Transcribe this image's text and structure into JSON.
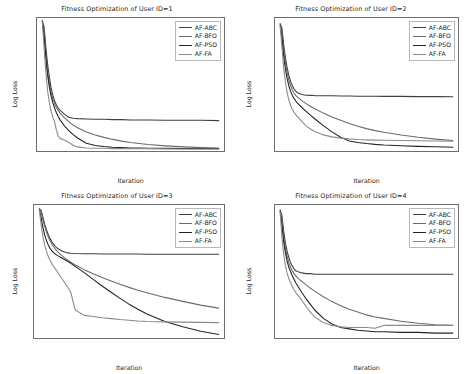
{
  "figure": {
    "background": "#ffffff",
    "series_colors": {
      "AF-ABC": "#3f3f3f",
      "AF-BFO": "#6b6b6b",
      "AF-PSO": "#242424",
      "AF-FA": "#8a8a8a"
    }
  },
  "chart_data": [
    {
      "type": "line",
      "title": "Fitness Optimization of User ID=1",
      "xlabel": "Iteration",
      "ylabel": "Log Loss",
      "xlim": [
        -30,
        1030
      ],
      "ylim": [
        0.335,
        0.725
      ],
      "xticks": [
        0,
        100,
        200,
        300,
        400,
        500,
        600,
        700,
        800,
        900,
        1000
      ],
      "yticks": [
        0.35,
        0.4,
        0.45,
        0.5,
        0.55,
        0.6,
        0.65,
        0.7
      ],
      "ytick_labels": [
        "0.35",
        "0.40",
        "0.45",
        "0.50",
        "0.55",
        "0.60",
        "0.65",
        "0.70"
      ],
      "grid": false,
      "legend_position": "upper right",
      "legend": [
        "AF-ABC",
        "AF-BFO",
        "AF-PSO",
        "AF-FA"
      ],
      "x": [
        0,
        10,
        20,
        30,
        40,
        50,
        60,
        70,
        80,
        90,
        100,
        125,
        150,
        175,
        200,
        250,
        300,
        350,
        400,
        450,
        500,
        550,
        600,
        700,
        800,
        900,
        1000
      ],
      "series": [
        {
          "name": "AF-ABC",
          "values": [
            0.715,
            0.7,
            0.64,
            0.59,
            0.552,
            0.52,
            0.498,
            0.482,
            0.47,
            0.461,
            0.455,
            0.443,
            0.434,
            0.431,
            0.43,
            0.429,
            0.428,
            0.428,
            0.427,
            0.427,
            0.426,
            0.426,
            0.426,
            0.425,
            0.425,
            0.425,
            0.424
          ]
        },
        {
          "name": "AF-BFO",
          "values": [
            0.718,
            0.688,
            0.62,
            0.57,
            0.533,
            0.506,
            0.487,
            0.473,
            0.462,
            0.454,
            0.447,
            0.433,
            0.421,
            0.411,
            0.403,
            0.391,
            0.382,
            0.375,
            0.369,
            0.364,
            0.36,
            0.357,
            0.354,
            0.35,
            0.347,
            0.345,
            0.344
          ]
        },
        {
          "name": "AF-PSO",
          "values": [
            0.716,
            0.672,
            0.606,
            0.558,
            0.523,
            0.496,
            0.476,
            0.46,
            0.447,
            0.436,
            0.427,
            0.409,
            0.395,
            0.383,
            0.373,
            0.358,
            0.351,
            0.348,
            0.346,
            0.345,
            0.344,
            0.344,
            0.343,
            0.343,
            0.342,
            0.342,
            0.342
          ]
        },
        {
          "name": "AF-FA",
          "values": [
            0.714,
            0.64,
            0.566,
            0.512,
            0.477,
            0.452,
            0.434,
            0.42,
            0.396,
            0.379,
            0.372,
            0.367,
            0.36,
            0.352,
            0.347,
            0.344,
            0.343,
            0.343,
            0.342,
            0.342,
            0.342,
            0.342,
            0.342,
            0.341,
            0.341,
            0.341,
            0.341
          ]
        }
      ]
    },
    {
      "type": "line",
      "title": "Fitness Optimization of User ID=2",
      "xlabel": "Iteration",
      "ylabel": "Log Loss",
      "xlim": [
        -30,
        1030
      ],
      "ylim": [
        0.925,
        1.585
      ],
      "xticks": [
        0,
        100,
        200,
        300,
        400,
        500,
        600,
        700,
        800,
        900,
        1000
      ],
      "yticks": [
        1.0,
        1.1,
        1.2,
        1.3,
        1.4,
        1.5
      ],
      "ytick_labels": [
        "1.0",
        "1.1",
        "1.2",
        "1.3",
        "1.4",
        "1.5"
      ],
      "grid": false,
      "legend_position": "upper right",
      "legend": [
        "AF-ABC",
        "AF-BFO",
        "AF-PSO",
        "AF-FA"
      ],
      "x": [
        0,
        10,
        20,
        30,
        40,
        50,
        60,
        70,
        80,
        90,
        100,
        125,
        150,
        175,
        200,
        250,
        300,
        350,
        400,
        450,
        500,
        550,
        600,
        700,
        800,
        900,
        1000
      ],
      "series": [
        {
          "name": "AF-ABC",
          "values": [
            1.555,
            1.535,
            1.455,
            1.39,
            1.34,
            1.3,
            1.272,
            1.25,
            1.234,
            1.222,
            1.214,
            1.205,
            1.202,
            1.201,
            1.2,
            1.199,
            1.199,
            1.198,
            1.198,
            1.197,
            1.197,
            1.197,
            1.196,
            1.196,
            1.195,
            1.195,
            1.194
          ]
        },
        {
          "name": "AF-BFO",
          "values": [
            1.558,
            1.52,
            1.432,
            1.366,
            1.316,
            1.278,
            1.25,
            1.229,
            1.213,
            1.201,
            1.192,
            1.175,
            1.16,
            1.147,
            1.135,
            1.113,
            1.094,
            1.077,
            1.061,
            1.048,
            1.036,
            1.026,
            1.018,
            1.004,
            0.993,
            0.984,
            0.977
          ]
        },
        {
          "name": "AF-PSO",
          "values": [
            1.55,
            1.49,
            1.398,
            1.333,
            1.285,
            1.249,
            1.222,
            1.202,
            1.186,
            1.173,
            1.163,
            1.141,
            1.122,
            1.103,
            1.085,
            1.051,
            1.02,
            0.993,
            0.975,
            0.967,
            0.962,
            0.958,
            0.955,
            0.951,
            0.948,
            0.946,
            0.944
          ]
        },
        {
          "name": "AF-FA",
          "values": [
            1.546,
            1.441,
            1.34,
            1.268,
            1.216,
            1.179,
            1.152,
            1.132,
            1.117,
            1.105,
            1.096,
            1.072,
            1.05,
            1.034,
            1.022,
            1.005,
            0.995,
            0.989,
            0.985,
            0.982,
            0.98,
            0.979,
            0.978,
            0.977,
            0.976,
            0.975,
            0.974
          ]
        }
      ]
    },
    {
      "type": "line",
      "title": "Fitness Optimization of User ID=3",
      "xlabel": "Iteration",
      "ylabel": "Log Loss",
      "xlim": [
        -30,
        1030
      ],
      "ylim": [
        0.365,
        0.935
      ],
      "xticks": [
        0,
        100,
        200,
        300,
        400,
        500,
        600,
        700,
        800,
        900,
        1000
      ],
      "yticks": [
        0.4,
        0.5,
        0.6,
        0.7,
        0.8,
        0.9
      ],
      "ytick_labels": [
        "0.4",
        "0.5",
        "0.6",
        "0.7",
        "0.8",
        "0.9"
      ],
      "grid": false,
      "legend_position": "upper right",
      "legend": [
        "AF-ABC",
        "AF-BFO",
        "AF-PSO",
        "AF-FA"
      ],
      "x": [
        0,
        10,
        20,
        30,
        40,
        50,
        60,
        70,
        80,
        90,
        100,
        125,
        150,
        175,
        200,
        250,
        300,
        350,
        400,
        450,
        500,
        550,
        600,
        700,
        800,
        900,
        1000
      ],
      "series": [
        {
          "name": "AF-ABC",
          "values": [
            0.918,
            0.912,
            0.882,
            0.853,
            0.828,
            0.808,
            0.791,
            0.777,
            0.766,
            0.757,
            0.75,
            0.738,
            0.731,
            0.728,
            0.727,
            0.726,
            0.726,
            0.725,
            0.725,
            0.725,
            0.725,
            0.725,
            0.724,
            0.724,
            0.724,
            0.724,
            0.724
          ]
        },
        {
          "name": "AF-BFO",
          "values": [
            0.921,
            0.906,
            0.871,
            0.842,
            0.818,
            0.798,
            0.781,
            0.767,
            0.755,
            0.745,
            0.736,
            0.718,
            0.703,
            0.69,
            0.678,
            0.658,
            0.64,
            0.624,
            0.609,
            0.595,
            0.582,
            0.57,
            0.559,
            0.539,
            0.522,
            0.506,
            0.493
          ]
        },
        {
          "name": "AF-PSO",
          "values": [
            0.915,
            0.88,
            0.838,
            0.806,
            0.782,
            0.763,
            0.749,
            0.738,
            0.73,
            0.724,
            0.719,
            0.708,
            0.697,
            0.685,
            0.672,
            0.645,
            0.616,
            0.588,
            0.561,
            0.535,
            0.51,
            0.488,
            0.468,
            0.436,
            0.413,
            0.394,
            0.38
          ]
        },
        {
          "name": "AF-FA",
          "values": [
            0.913,
            0.848,
            0.799,
            0.762,
            0.735,
            0.714,
            0.697,
            0.683,
            0.671,
            0.66,
            0.65,
            0.62,
            0.592,
            0.562,
            0.485,
            0.462,
            0.457,
            0.452,
            0.448,
            0.444,
            0.441,
            0.438,
            0.436,
            0.434,
            0.433,
            0.432,
            0.431
          ]
        }
      ]
    },
    {
      "type": "line",
      "title": "Fitness Optimization of User ID=4",
      "xlabel": "Iteration",
      "ylabel": "Log Loss",
      "xlim": [
        -30,
        1030
      ],
      "ylim": [
        0.268,
        0.458
      ],
      "xticks": [
        0,
        100,
        200,
        300,
        400,
        500,
        600,
        700,
        800,
        900,
        1000
      ],
      "yticks": [
        0.275,
        0.3,
        0.325,
        0.35,
        0.375,
        0.4,
        0.425,
        0.45
      ],
      "ytick_labels": [
        "0.275",
        "0.300",
        "0.325",
        "0.350",
        "0.375",
        "0.400",
        "0.425",
        "0.450"
      ],
      "grid": false,
      "legend_position": "upper right",
      "legend": [
        "AF-ABC",
        "AF-BFO",
        "AF-PSO",
        "AF-FA"
      ],
      "x": [
        0,
        10,
        20,
        30,
        40,
        50,
        60,
        70,
        80,
        90,
        100,
        125,
        150,
        175,
        200,
        250,
        300,
        350,
        400,
        450,
        500,
        550,
        600,
        700,
        800,
        900,
        1000
      ],
      "series": [
        {
          "name": "AF-ABC",
          "values": [
            0.45,
            0.443,
            0.421,
            0.404,
            0.392,
            0.383,
            0.376,
            0.371,
            0.367,
            0.364,
            0.363,
            0.361,
            0.36,
            0.36,
            0.359,
            0.359,
            0.359,
            0.359,
            0.359,
            0.359,
            0.359,
            0.359,
            0.359,
            0.359,
            0.359,
            0.359,
            0.359
          ]
        },
        {
          "name": "AF-BFO",
          "values": [
            0.451,
            0.438,
            0.414,
            0.397,
            0.385,
            0.376,
            0.369,
            0.364,
            0.36,
            0.357,
            0.354,
            0.349,
            0.344,
            0.339,
            0.335,
            0.327,
            0.32,
            0.314,
            0.309,
            0.305,
            0.301,
            0.298,
            0.296,
            0.292,
            0.289,
            0.287,
            0.286
          ]
        },
        {
          "name": "AF-PSO",
          "values": [
            0.449,
            0.429,
            0.406,
            0.39,
            0.378,
            0.369,
            0.363,
            0.357,
            0.352,
            0.347,
            0.343,
            0.333,
            0.324,
            0.316,
            0.308,
            0.296,
            0.288,
            0.283,
            0.281,
            0.279,
            0.278,
            0.277,
            0.277,
            0.276,
            0.276,
            0.275,
            0.275
          ]
        },
        {
          "name": "AF-FA",
          "values": [
            0.448,
            0.412,
            0.388,
            0.372,
            0.361,
            0.353,
            0.347,
            0.342,
            0.337,
            0.333,
            0.33,
            0.322,
            0.313,
            0.305,
            0.298,
            0.29,
            0.286,
            0.284,
            0.283,
            0.283,
            0.283,
            0.282,
            0.286,
            0.286,
            0.286,
            0.286,
            0.286
          ]
        }
      ]
    }
  ]
}
